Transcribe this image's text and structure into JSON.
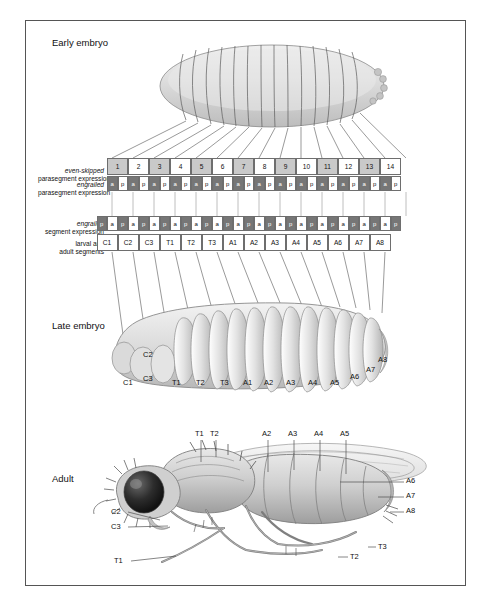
{
  "figure": {
    "title": "Parasegments",
    "footer_caption": "Segments",
    "stage_labels": {
      "early": "Early embryo",
      "late": "Late embryo",
      "adult": "Adult"
    }
  },
  "row_labels": {
    "even_skipped": {
      "gene": "even-skipped",
      "desc": "parasegment expression"
    },
    "engrailed_para": {
      "gene": "engrailed",
      "desc": "parasegment expression"
    },
    "engrailed_seg": {
      "gene": "engrailed",
      "desc": "segment expression"
    },
    "segments": {
      "line1": "larval and",
      "line2": "adult segments"
    }
  },
  "chart_data": {
    "type": "table",
    "parasegments": {
      "label": "even-skipped parasegment expression",
      "values": [
        "1",
        "2",
        "3",
        "4",
        "5",
        "6",
        "7",
        "8",
        "9",
        "10",
        "11",
        "12",
        "13",
        "14"
      ],
      "shading": [
        "gray",
        "white",
        "gray",
        "white",
        "gray",
        "white",
        "gray",
        "white",
        "gray",
        "white",
        "gray",
        "white",
        "gray",
        "white"
      ]
    },
    "engrailed_parasegment": {
      "label": "engrailed parasegment expression",
      "pattern": [
        "a",
        "p"
      ],
      "repeats": 14,
      "compartments": [
        "a",
        "p",
        "a",
        "p",
        "a",
        "p",
        "a",
        "p",
        "a",
        "p",
        "a",
        "p",
        "a",
        "p",
        "a",
        "p",
        "a",
        "p",
        "a",
        "p",
        "a",
        "p",
        "a",
        "p",
        "a",
        "p",
        "a",
        "p"
      ],
      "shading": [
        "dark",
        "white",
        "dark",
        "white",
        "dark",
        "white",
        "dark",
        "white",
        "dark",
        "white",
        "dark",
        "white",
        "dark",
        "white",
        "dark",
        "white",
        "dark",
        "white",
        "dark",
        "white",
        "dark",
        "white",
        "dark",
        "white",
        "dark",
        "white",
        "dark",
        "white"
      ]
    },
    "engrailed_segment": {
      "label": "engrailed segment expression",
      "compartments": [
        "p",
        "a",
        "p",
        "a",
        "p",
        "a",
        "p",
        "a",
        "p",
        "a",
        "p",
        "a",
        "p",
        "a",
        "p",
        "a",
        "p",
        "a",
        "p",
        "a",
        "p",
        "a",
        "p",
        "a",
        "p",
        "a",
        "p",
        "a",
        "p"
      ],
      "shading": [
        "dark",
        "white",
        "dark",
        "white",
        "dark",
        "white",
        "dark",
        "white",
        "dark",
        "white",
        "dark",
        "white",
        "dark",
        "white",
        "dark",
        "white",
        "dark",
        "white",
        "dark",
        "white",
        "dark",
        "white",
        "dark",
        "white",
        "dark",
        "white",
        "dark",
        "white",
        "dark"
      ]
    },
    "segments": {
      "label": "larval and adult segments",
      "values": [
        "C1",
        "C2",
        "C3",
        "T1",
        "T2",
        "T3",
        "A1",
        "A2",
        "A3",
        "A4",
        "A5",
        "A6",
        "A7",
        "A8"
      ]
    }
  },
  "late_embryo_labels": [
    "C1",
    "C2",
    "C3",
    "T1",
    "T2",
    "T3",
    "A1",
    "A2",
    "A3",
    "A4",
    "A5",
    "A6",
    "A7",
    "A8"
  ],
  "adult_labels": {
    "top": [
      "T1",
      "T2",
      "A2",
      "A3",
      "A4",
      "A5"
    ],
    "right": [
      "A6",
      "A7",
      "A8"
    ],
    "left": [
      "C2",
      "C3",
      "T1"
    ],
    "bottom_right": [
      "T3",
      "T2"
    ]
  },
  "colors": {
    "gray_cell": "#c9c9c9",
    "dark_cell": "#767676",
    "white_cell": "#ffffff",
    "border": "#6e6e6e",
    "line": "#4a4a4a",
    "body_fill": "#d2d2d2"
  }
}
